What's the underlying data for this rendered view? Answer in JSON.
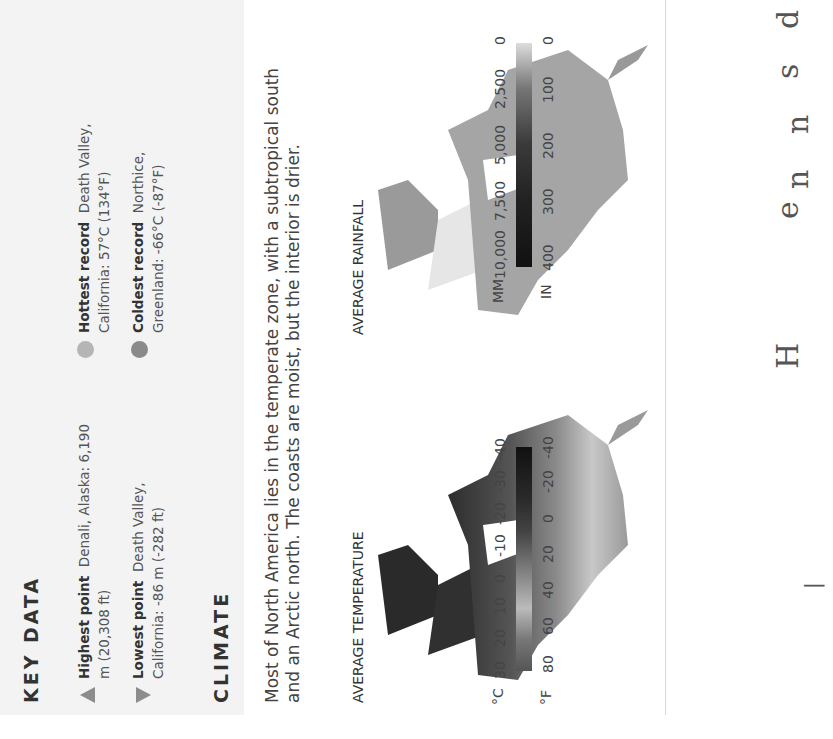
{
  "key_data": {
    "heading": "KEY DATA",
    "items": [
      {
        "icon": "triangle-up",
        "label": "Highest point",
        "text": "Denali, Alaska: 6,190 m (20,308 ft)"
      },
      {
        "icon": "triangle-down",
        "label": "Lowest point",
        "text": "Death Valley, California: -86 m (-282 ft)"
      },
      {
        "icon": "dot-light",
        "label": "Hottest record",
        "text": "Death Valley, California: 57°C (134°F)",
        "color": "#b5b5b5"
      },
      {
        "icon": "dot-dark",
        "label": "Coldest record",
        "text": "Northice, Greenland: -66°C (-87°F)",
        "color": "#8a8a8a"
      }
    ]
  },
  "climate": {
    "heading": "CLIMATE",
    "paragraph": "Most of North America lies in the temperate zone, with a subtropical south and an Arctic north. The coasts are moist, but the interior is drier.",
    "maps": [
      {
        "title": "AVERAGE TEMPERATURE",
        "legend": {
          "unit_left": "°C",
          "unit_right": "°F",
          "left_ticks": [
            "30",
            "20",
            "10",
            "0",
            "-10",
            "-20",
            "-30",
            "-40"
          ],
          "right_ticks": [
            "80",
            "60",
            "40",
            "20",
            "0",
            "-20",
            "-40"
          ]
        }
      },
      {
        "title": "AVERAGE RAINFALL",
        "legend": {
          "unit_left": "MM",
          "unit_right": "IN",
          "left_ticks": [
            "10,000",
            "7,500",
            "5,000",
            "2,500",
            "0"
          ],
          "right_ticks": [
            "400",
            "300",
            "200",
            "100",
            "0"
          ]
        }
      }
    ]
  },
  "facing_page_fragments": [
    "|",
    "H",
    "e",
    "n",
    "s",
    "d"
  ]
}
